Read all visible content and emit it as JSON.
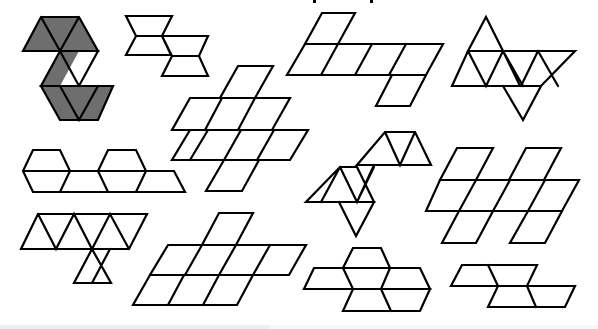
{
  "figure": {
    "nets": [
      {
        "id": "net-1",
        "shaded": true,
        "faces": 8
      },
      {
        "id": "net-2",
        "shaded": false,
        "faces": 8
      },
      {
        "id": "net-3",
        "shaded": false,
        "faces": 8
      },
      {
        "id": "net-4",
        "shaded": false,
        "faces": 8
      },
      {
        "id": "net-5",
        "shaded": false,
        "faces": 8
      },
      {
        "id": "net-6",
        "shaded": false,
        "faces": 8
      },
      {
        "id": "net-7",
        "shaded": false,
        "faces": 8
      },
      {
        "id": "net-8",
        "shaded": false,
        "faces": 8
      },
      {
        "id": "net-9",
        "shaded": false,
        "faces": 8
      },
      {
        "id": "net-10",
        "shaded": false,
        "faces": 8
      },
      {
        "id": "net-11",
        "shaded": false,
        "faces": 8
      },
      {
        "id": "net-12",
        "shaded": false,
        "faces": 8
      }
    ],
    "colors": {
      "stroke": "#000000",
      "shade": "#6e6e6e",
      "background": "#ffffff"
    }
  }
}
